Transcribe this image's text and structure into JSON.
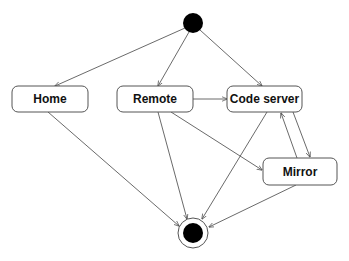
{
  "diagram": {
    "type": "state-machine",
    "start": {
      "cx": 193,
      "cy": 23,
      "r": 10,
      "color": "#000000"
    },
    "end": {
      "cx": 193,
      "cy": 233,
      "outer_r": 15,
      "inner_r": 10,
      "color": "#000000"
    },
    "states": [
      {
        "id": "home",
        "label": "Home",
        "x": 12,
        "y": 86,
        "w": 76,
        "h": 26
      },
      {
        "id": "remote",
        "label": "Remote",
        "x": 117,
        "y": 86,
        "w": 76,
        "h": 26
      },
      {
        "id": "code_server",
        "label": "Code server",
        "x": 227,
        "y": 86,
        "w": 75,
        "h": 26
      },
      {
        "id": "mirror",
        "label": "Mirror",
        "x": 263,
        "y": 158,
        "w": 74,
        "h": 27
      }
    ],
    "transitions": [
      {
        "from": "start",
        "to": "home",
        "x1": 185,
        "y1": 28,
        "x2": 55,
        "y2": 86
      },
      {
        "from": "start",
        "to": "remote",
        "x1": 189,
        "y1": 32,
        "x2": 158,
        "y2": 86
      },
      {
        "from": "start",
        "to": "code_server",
        "x1": 200,
        "y1": 30,
        "x2": 262,
        "y2": 86
      },
      {
        "from": "remote",
        "to": "code_server",
        "x1": 193,
        "y1": 99,
        "x2": 227,
        "y2": 99
      },
      {
        "from": "home",
        "to": "end",
        "x1": 48,
        "y1": 112,
        "x2": 179,
        "y2": 226
      },
      {
        "from": "remote",
        "to": "end",
        "x1": 158,
        "y1": 112,
        "x2": 187,
        "y2": 219
      },
      {
        "from": "remote",
        "to": "mirror",
        "x1": 171,
        "y1": 112,
        "x2": 262,
        "y2": 170
      },
      {
        "from": "code_server",
        "to": "end",
        "x1": 267,
        "y1": 112,
        "x2": 202,
        "y2": 219
      },
      {
        "from": "code_server",
        "to": "mirror",
        "x1": 293,
        "y1": 112,
        "x2": 310,
        "y2": 157
      },
      {
        "from": "mirror",
        "to": "code_server",
        "x1": 297,
        "y1": 158,
        "x2": 281,
        "y2": 113
      },
      {
        "from": "mirror",
        "to": "end",
        "x1": 296,
        "y1": 185,
        "x2": 209,
        "y2": 227
      }
    ]
  }
}
